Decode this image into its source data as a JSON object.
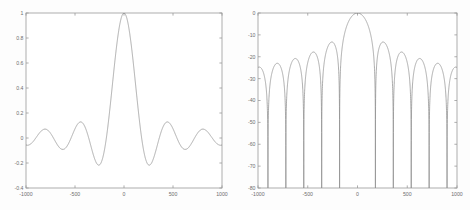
{
  "figure": {
    "background_color": "#fdfdfd",
    "axis_color": "#9a9a9a",
    "line_color": "#8f8f8f",
    "width": 470,
    "height": 210
  },
  "chart_data": [
    {
      "type": "line",
      "id": "linear-beam-pattern",
      "title": "",
      "subtitle": "",
      "xlabel": "",
      "ylabel": "",
      "xlim": [
        -1000,
        1000
      ],
      "ylim": [
        -0.4,
        1.0
      ],
      "grid": false,
      "legend": [],
      "xticks": [
        -1000,
        -500,
        0,
        500,
        1000
      ],
      "xticklabels": [
        "-1000",
        "-500",
        "0",
        "500",
        "1000"
      ],
      "yticks": [
        -0.4,
        -0.2,
        0,
        0.2,
        0.4,
        0.6,
        0.8,
        1
      ],
      "yticklabels": [
        "-0.4",
        "-0.2",
        "0",
        "0.2",
        "0.4",
        "0.6",
        "0.8",
        "1"
      ],
      "series": [
        {
          "name": "sinc pattern (linear)",
          "function": "sinc",
          "null_spacing": 180,
          "peak_value": 1.0,
          "peak_x": 0,
          "sidelobe_peaks_x": [
            -795,
            -615,
            -440,
            -260,
            260,
            440,
            615,
            795
          ],
          "sidelobe_peaks_y": [
            0.07,
            -0.09,
            0.128,
            -0.215,
            -0.215,
            0.128,
            -0.09,
            0.07
          ],
          "value_at_minus1000": -0.057,
          "value_at_plus1000": -0.057
        }
      ]
    },
    {
      "type": "line",
      "id": "db-beam-pattern",
      "title": "",
      "subtitle": "",
      "xlabel": "",
      "ylabel": "",
      "xlim": [
        -1000,
        1000
      ],
      "ylim": [
        -80,
        0
      ],
      "grid": false,
      "legend": [],
      "xticks": [
        -1000,
        -500,
        0,
        500,
        1000
      ],
      "xticklabels": [
        "-1000",
        "-500",
        "0",
        "500",
        "1000"
      ],
      "yticks": [
        -80,
        -70,
        -60,
        -50,
        -40,
        -30,
        -20,
        -10,
        0
      ],
      "yticklabels": [
        "-80",
        "-70",
        "-60",
        "-50",
        "-40",
        "-30",
        "-20",
        "-10",
        "0"
      ],
      "series": [
        {
          "name": "sinc pattern (dB)",
          "function": "20*log10(|sinc|)",
          "null_spacing": 180,
          "peak_value_db": 0,
          "peak_x": 0,
          "sidelobe_peaks_x": [
            -900,
            -710,
            -530,
            -355,
            -260,
            260,
            355,
            530,
            710,
            900
          ],
          "sidelobe_peaks_db": [
            -26.0,
            -24.4,
            -22.5,
            -20.0,
            -13.5,
            -13.5,
            -17.8,
            -20.6,
            -23.5,
            -25.5
          ],
          "null_positions_x": [
            -900,
            -720,
            -540,
            -360,
            -180,
            180,
            360,
            540,
            720,
            900
          ],
          "value_at_minus1000_db": -24.5,
          "value_at_plus1000_db": -24.5
        }
      ]
    }
  ],
  "panels": {
    "left": {
      "name": "linear-plot",
      "plot_box": {
        "x": 26,
        "y": 13,
        "width": 196,
        "height": 175
      }
    },
    "right": {
      "name": "db-plot",
      "plot_box": {
        "x": 23,
        "y": 13,
        "width": 199,
        "height": 175
      }
    }
  }
}
